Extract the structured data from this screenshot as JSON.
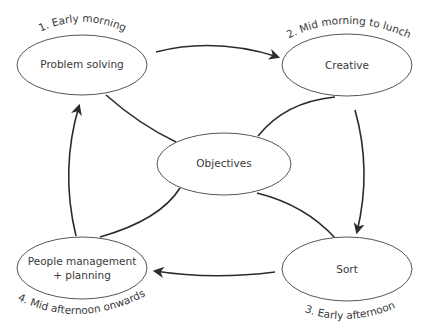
{
  "diagram": {
    "center": {
      "label": "Objectives"
    },
    "nodes": [
      {
        "id": "problem",
        "label": "Problem solving",
        "time": "1. Early morning"
      },
      {
        "id": "creative",
        "label": "Creative",
        "time": "2. Mid morning to lunch"
      },
      {
        "id": "sort",
        "label": "Sort",
        "time": "3. Early afternoon"
      },
      {
        "id": "people",
        "label_line1": "People management",
        "label_line2": "+ planning",
        "time": "4. Mid afternoon onwards"
      }
    ],
    "stroke_color": "#2b2b2b",
    "ellipse_stroke": "#555555"
  }
}
